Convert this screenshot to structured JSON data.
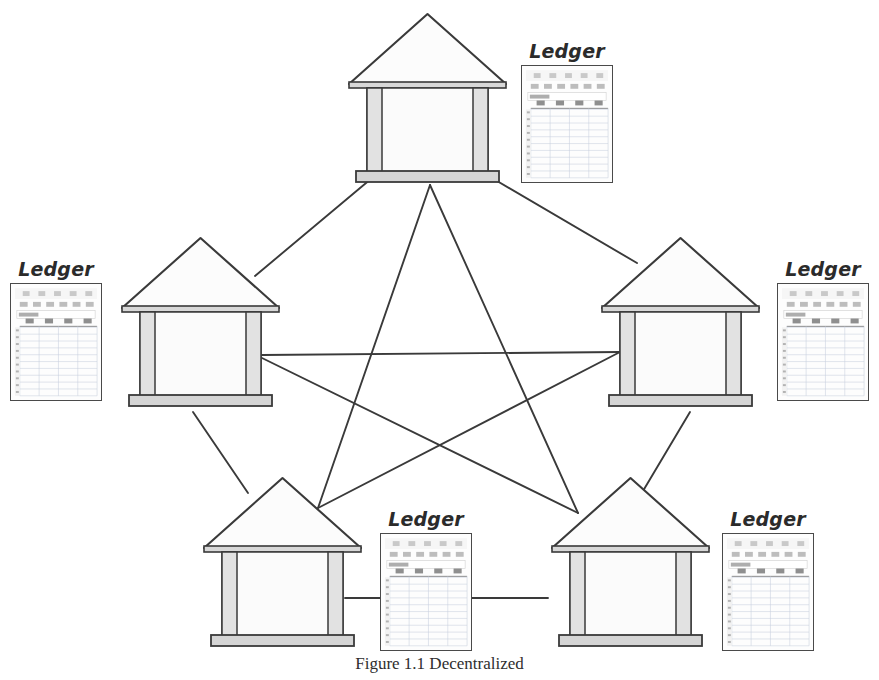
{
  "figure": {
    "caption": "Figure 1.1 Decentralized",
    "background_color": "#ffffff",
    "line_color": "#3a3a3a",
    "ink_color": "#2b2b2b"
  },
  "ledger_label": "Ledger",
  "ledger_sheet": {
    "formula_cell_text": "Ledger",
    "columns": [
      "Name",
      "Date",
      "Amount",
      "Type"
    ],
    "row_count": 10,
    "column_letters": [
      "A",
      "B",
      "C",
      "D"
    ]
  },
  "nodes": [
    {
      "id": "node-top",
      "name": "pavilion-top",
      "x": 345,
      "y": 8,
      "ledger_x": 521,
      "ledger_y": 40,
      "ledger_label_align": "center"
    },
    {
      "id": "node-left",
      "name": "pavilion-left",
      "x": 118,
      "y": 232,
      "ledger_x": 10,
      "ledger_y": 258,
      "ledger_label_align": "center"
    },
    {
      "id": "node-right",
      "name": "pavilion-right",
      "x": 598,
      "y": 232,
      "ledger_x": 777,
      "ledger_y": 258,
      "ledger_label_align": "center"
    },
    {
      "id": "node-bottom-left",
      "name": "pavilion-bottom-left",
      "x": 200,
      "y": 472,
      "ledger_x": 380,
      "ledger_y": 508,
      "ledger_label_align": "center"
    },
    {
      "id": "node-bottom-right",
      "name": "pavilion-bottom-right",
      "x": 548,
      "y": 472,
      "ledger_x": 722,
      "ledger_y": 508,
      "ledger_label_align": "center"
    }
  ],
  "connections": [
    {
      "name": "edge-top-to-left",
      "x1": 372,
      "y1": 178,
      "x2": 255,
      "y2": 276
    },
    {
      "name": "edge-top-to-right",
      "x1": 492,
      "y1": 178,
      "x2": 637,
      "y2": 263
    },
    {
      "name": "edge-top-to-bottom-left",
      "x1": 430,
      "y1": 185,
      "x2": 318,
      "y2": 508
    },
    {
      "name": "edge-top-to-bottom-right",
      "x1": 430,
      "y1": 185,
      "x2": 578,
      "y2": 513
    },
    {
      "name": "edge-left-to-right",
      "x1": 262,
      "y1": 355,
      "x2": 620,
      "y2": 352
    },
    {
      "name": "edge-left-to-bottom-left",
      "x1": 193,
      "y1": 412,
      "x2": 248,
      "y2": 493
    },
    {
      "name": "edge-right-to-bottom-right",
      "x1": 690,
      "y1": 412,
      "x2": 640,
      "y2": 496
    },
    {
      "name": "edge-left-to-bottom-right",
      "x1": 262,
      "y1": 358,
      "x2": 578,
      "y2": 513
    },
    {
      "name": "edge-right-to-bottom-left",
      "x1": 620,
      "y1": 352,
      "x2": 318,
      "y2": 508
    },
    {
      "name": "edge-bottom-left-to-bottom-right",
      "x1": 345,
      "y1": 598,
      "x2": 548,
      "y2": 598
    }
  ]
}
